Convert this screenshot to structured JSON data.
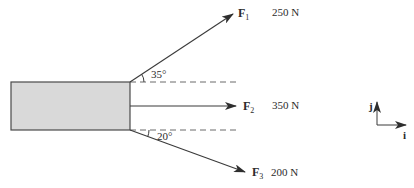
{
  "diagram": {
    "type": "force-diagram",
    "block": {
      "fill": "#d9d9d9",
      "stroke": "#4a4a4a"
    },
    "forces": [
      {
        "name": "F",
        "subscript": "1",
        "magnitude": "250 N",
        "angle_label": "35°",
        "direction": "above horizontal"
      },
      {
        "name": "F",
        "subscript": "2",
        "magnitude": "350 N",
        "direction": "horizontal"
      },
      {
        "name": "F",
        "subscript": "3",
        "magnitude": "200 N",
        "angle_label": "20°",
        "direction": "below horizontal"
      }
    ],
    "axes": {
      "x_label": "i",
      "y_label": "j"
    },
    "colors": {
      "line": "#3a3a3a",
      "dash": "#6a6a6a",
      "text": "#2b2b2b"
    }
  }
}
